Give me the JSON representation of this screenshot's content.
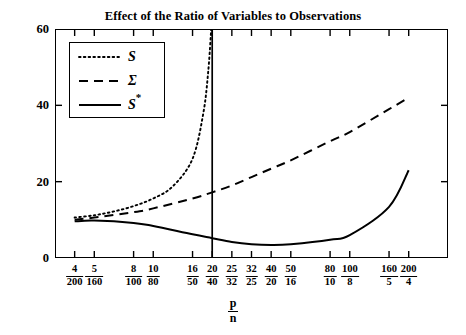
{
  "chart_data": {
    "type": "line",
    "title": "Effect of the Ratio of Variables to Observations",
    "xlabel_num": "p",
    "xlabel_den": "n",
    "ylabel": "Condition Number",
    "ylim": [
      0,
      60
    ],
    "yticks": [
      0,
      20,
      40,
      60
    ],
    "grid": false,
    "legend_position": "upper-left-inside",
    "xtick_labels": [
      {
        "num": "4",
        "den": "200"
      },
      {
        "num": "5",
        "den": "160"
      },
      {
        "num": "8",
        "den": "100"
      },
      {
        "num": "10",
        "den": "80"
      },
      {
        "num": "16",
        "den": "50"
      },
      {
        "num": "20",
        "den": "40"
      },
      {
        "num": "25",
        "den": "32"
      },
      {
        "num": "32",
        "den": "25"
      },
      {
        "num": "40",
        "den": "20"
      },
      {
        "num": "50",
        "den": "16"
      },
      {
        "num": "80",
        "den": "10"
      },
      {
        "num": "100",
        "den": "8"
      },
      {
        "num": "160",
        "den": "5"
      },
      {
        "num": "200",
        "den": "4"
      }
    ],
    "xtick_index": [
      1,
      2,
      4,
      5,
      7,
      8,
      9,
      10,
      11,
      12,
      14,
      15,
      17,
      18
    ],
    "x_slots": 20,
    "annotations": [
      {
        "type": "vline",
        "x_index": 8,
        "label": "p/n = 1 reference line"
      }
    ],
    "series": [
      {
        "name": "S",
        "style": "dotted",
        "x": [
          1,
          2,
          3,
          4,
          5,
          6,
          7,
          7.55,
          7.8,
          7.95
        ],
        "values": [
          10.6,
          11.2,
          12.2,
          13.6,
          15.6,
          18.8,
          26.0,
          38.0,
          49.0,
          60.0
        ]
      },
      {
        "name": "Σ",
        "style": "dashed",
        "x": [
          1,
          2,
          4,
          5,
          7,
          8,
          9,
          10,
          11,
          12,
          14,
          15,
          17,
          18
        ],
        "values": [
          10.0,
          10.6,
          12.0,
          13.0,
          15.6,
          17.2,
          19.0,
          21.2,
          23.4,
          25.6,
          30.6,
          33.0,
          39.0,
          42.0
        ]
      },
      {
        "name": "S*",
        "style": "solid",
        "x": [
          1,
          2,
          4,
          5,
          7,
          8,
          9,
          10,
          11,
          12,
          14,
          15,
          17,
          18
        ],
        "values": [
          9.6,
          9.8,
          9.2,
          8.4,
          6.2,
          5.2,
          4.2,
          3.6,
          3.4,
          3.6,
          4.8,
          6.0,
          13.4,
          23.0
        ]
      }
    ]
  },
  "legend": {
    "entries": [
      {
        "label": "S",
        "star": "",
        "style": "dotted"
      },
      {
        "label": "Σ",
        "star": "",
        "style": "dashed"
      },
      {
        "label": "S",
        "star": "*",
        "style": "solid"
      }
    ]
  },
  "colors": {
    "line": "#000000",
    "frame": "#000000",
    "background": "#ffffff"
  }
}
